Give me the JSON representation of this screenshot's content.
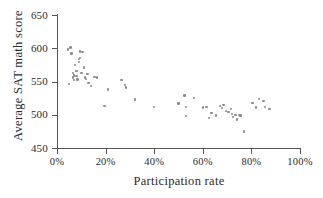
{
  "chart_data": {
    "type": "scatter",
    "title": "",
    "xlabel": "Participation rate",
    "ylabel": "Average SAT math score",
    "xlim": [
      0,
      100
    ],
    "ylim": [
      450,
      650
    ],
    "x_tick_labels": [
      "0%",
      "20%",
      "40%",
      "60%",
      "80%",
      "100%"
    ],
    "x_ticks": [
      0,
      20,
      40,
      60,
      80,
      100
    ],
    "y_tick_labels": [
      "450",
      "500",
      "550",
      "600",
      "650"
    ],
    "y_ticks": [
      450,
      500,
      550,
      600,
      650
    ],
    "grid": false,
    "legend": null,
    "marker_color": "#8a8a8f",
    "axis_color": "#555555",
    "points": [
      {
        "x": 4.5,
        "y": 598
      },
      {
        "x": 5.5,
        "y": 601
      },
      {
        "x": 5.0,
        "y": 546
      },
      {
        "x": 6.0,
        "y": 592
      },
      {
        "x": 6.5,
        "y": 563
      },
      {
        "x": 6.5,
        "y": 556
      },
      {
        "x": 7.0,
        "y": 559
      },
      {
        "x": 7.0,
        "y": 552
      },
      {
        "x": 7.5,
        "y": 575
      },
      {
        "x": 8.0,
        "y": 566
      },
      {
        "x": 8.0,
        "y": 558
      },
      {
        "x": 8.5,
        "y": 553
      },
      {
        "x": 9.0,
        "y": 584
      },
      {
        "x": 9.0,
        "y": 579
      },
      {
        "x": 9.5,
        "y": 595
      },
      {
        "x": 9.5,
        "y": 585
      },
      {
        "x": 10.0,
        "y": 563
      },
      {
        "x": 10.5,
        "y": 594
      },
      {
        "x": 11.0,
        "y": 571
      },
      {
        "x": 11.5,
        "y": 556
      },
      {
        "x": 12.0,
        "y": 554
      },
      {
        "x": 12.5,
        "y": 561
      },
      {
        "x": 13.0,
        "y": 548
      },
      {
        "x": 14.0,
        "y": 543
      },
      {
        "x": 15.5,
        "y": 557
      },
      {
        "x": 16.5,
        "y": 556
      },
      {
        "x": 19.5,
        "y": 513
      },
      {
        "x": 21.0,
        "y": 538
      },
      {
        "x": 26.5,
        "y": 552
      },
      {
        "x": 28.0,
        "y": 545
      },
      {
        "x": 28.5,
        "y": 541
      },
      {
        "x": 32.0,
        "y": 523
      },
      {
        "x": 40.0,
        "y": 512
      },
      {
        "x": 50.0,
        "y": 517
      },
      {
        "x": 52.5,
        "y": 529
      },
      {
        "x": 53.0,
        "y": 512
      },
      {
        "x": 53.0,
        "y": 498
      },
      {
        "x": 56.5,
        "y": 525
      },
      {
        "x": 60.0,
        "y": 511
      },
      {
        "x": 61.5,
        "y": 512
      },
      {
        "x": 62.5,
        "y": 495
      },
      {
        "x": 63.5,
        "y": 503
      },
      {
        "x": 65.5,
        "y": 499
      },
      {
        "x": 67.0,
        "y": 513
      },
      {
        "x": 68.0,
        "y": 510
      },
      {
        "x": 68.5,
        "y": 515
      },
      {
        "x": 69.5,
        "y": 506
      },
      {
        "x": 70.5,
        "y": 504
      },
      {
        "x": 71.5,
        "y": 509
      },
      {
        "x": 72.0,
        "y": 501
      },
      {
        "x": 72.5,
        "y": 497
      },
      {
        "x": 73.5,
        "y": 500
      },
      {
        "x": 74.0,
        "y": 493
      },
      {
        "x": 75.0,
        "y": 500
      },
      {
        "x": 75.5,
        "y": 499
      },
      {
        "x": 77.0,
        "y": 475
      },
      {
        "x": 80.5,
        "y": 518
      },
      {
        "x": 82.0,
        "y": 511
      },
      {
        "x": 83.0,
        "y": 524
      },
      {
        "x": 85.0,
        "y": 521
      },
      {
        "x": 85.5,
        "y": 512
      },
      {
        "x": 87.5,
        "y": 509
      }
    ]
  }
}
